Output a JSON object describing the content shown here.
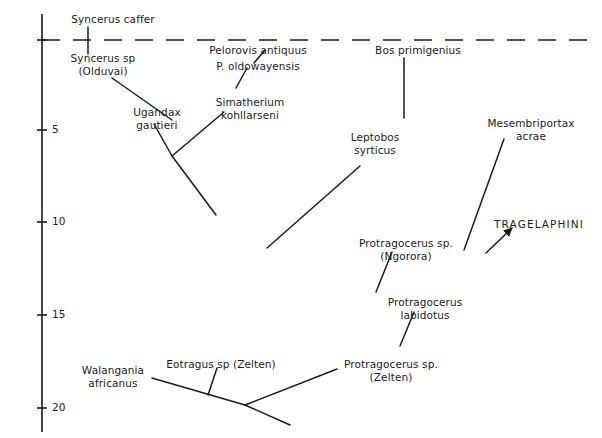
{
  "figure": {
    "type": "phylogenetic-tree",
    "background_color": "#ffffff",
    "line_color": "#1a1a1a",
    "axis": {
      "name": "geologic-time-axis",
      "orientation": "vertical",
      "unit_implied": "Ma",
      "ticks": [
        {
          "label": "5",
          "value": 5,
          "y": 130
        },
        {
          "label": "10",
          "value": 10,
          "y": 222
        },
        {
          "label": "15",
          "value": 15,
          "y": 315
        },
        {
          "label": "20",
          "value": 20,
          "y": 408
        }
      ],
      "top_datum_tick": {
        "label": "",
        "value": 0,
        "y": 40
      },
      "x": 42,
      "y_top": 14,
      "y_bottom": 432
    },
    "datum_line": {
      "name": "present-day-dashed-line",
      "style": "dashed",
      "y": 40,
      "x_start": 42,
      "x_end": 598
    }
  },
  "taxa": [
    {
      "id": "syncerus-caffer",
      "label": "Syncerus caffer",
      "lines": [
        "Syncerus caffer"
      ],
      "x": 113,
      "y": 13,
      "align": "center",
      "style": "italic-latin"
    },
    {
      "id": "syncerus-sp-olduvai",
      "label": "Syncerus sp (Olduvai)",
      "lines": [
        "Syncerus sp",
        "(Olduvai)"
      ],
      "x": 103,
      "y": 52,
      "align": "center",
      "style": "italic-latin"
    },
    {
      "id": "pelorovis-antiquus",
      "label": "Pelorovis antiquus",
      "lines": [
        "Pelorovis antiquus"
      ],
      "x": 258,
      "y": 44,
      "align": "center",
      "style": "italic-latin"
    },
    {
      "id": "p-oldowayensis",
      "label": "P. oldowayensis",
      "lines": [
        "P. oldowayensis"
      ],
      "x": 258,
      "y": 60,
      "align": "center",
      "style": "italic-latin"
    },
    {
      "id": "bos-primigenius",
      "label": "Bos primigenius",
      "lines": [
        "Bos primigenius"
      ],
      "x": 418,
      "y": 44,
      "align": "center",
      "style": "italic-latin"
    },
    {
      "id": "simatherium-kohllarseni",
      "label": "Simatherium kohllarseni",
      "lines": [
        "Simatherium",
        "kohllarseni"
      ],
      "x": 250,
      "y": 96,
      "align": "center",
      "style": "italic-latin"
    },
    {
      "id": "ugandax-gautieri",
      "label": "Ugandax gautieri",
      "lines": [
        "Ugandax",
        "gautieri"
      ],
      "x": 157,
      "y": 106,
      "align": "center",
      "style": "italic-latin"
    },
    {
      "id": "leptobos-syrticus",
      "label": "Leptobos syrticus",
      "lines": [
        "Leptobos",
        "syrticus"
      ],
      "x": 375,
      "y": 131,
      "align": "center",
      "style": "italic-latin"
    },
    {
      "id": "mesembriportax-acrae",
      "label": "Mesembriportax acrae",
      "lines": [
        "Mesembriportax",
        "acrae"
      ],
      "x": 531,
      "y": 117,
      "align": "center",
      "style": "italic-latin"
    },
    {
      "id": "tragelaphini",
      "label": "TRAGELAPHINI",
      "lines": [
        "TRAGELAPHINI"
      ],
      "x": 539,
      "y": 218,
      "align": "center",
      "style": "tribe-caps"
    },
    {
      "id": "protragocerus-sp-ngorora",
      "label": "Protragocerus sp. (Ngorora)",
      "lines": [
        "Protragocerus sp.",
        "(Ngorora)"
      ],
      "x": 406,
      "y": 237,
      "align": "center",
      "style": "italic-latin"
    },
    {
      "id": "protragocerus-labidotus",
      "label": "Protragocerus labidotus",
      "lines": [
        "Protragocerus",
        "labidotus"
      ],
      "x": 425,
      "y": 296,
      "align": "center",
      "style": "italic-latin"
    },
    {
      "id": "eotragus-sp-zelten",
      "label": "Eotragus sp (Zelten)",
      "lines": [
        "Eotragus sp (Zelten)"
      ],
      "x": 221,
      "y": 358,
      "align": "center",
      "style": "italic-latin"
    },
    {
      "id": "protragocerus-sp-zelten",
      "label": "Protragocerus sp. (Zelten)",
      "lines": [
        "Protragocerus sp.",
        "(Zelten)"
      ],
      "x": 391,
      "y": 358,
      "align": "center",
      "style": "italic-latin"
    },
    {
      "id": "walangania-africanus",
      "label": "Walangania africanus",
      "lines": [
        "Walangania",
        "africanus"
      ],
      "x": 113,
      "y": 364,
      "align": "center",
      "style": "italic-latin"
    }
  ],
  "branches": [
    {
      "id": "syncerus-caffer-stem",
      "type": "line",
      "points": "88,27 88,54"
    },
    {
      "id": "bos-primigenius-stem",
      "type": "line",
      "points": "404,58 404,118"
    },
    {
      "id": "syncerus-sp-to-node",
      "type": "line",
      "points": "112,78 172,120"
    },
    {
      "id": "pelorovis-to-oldowayensis",
      "type": "line",
      "points": "265,50 254,63"
    },
    {
      "id": "oldowayensis-to-simatherium",
      "type": "line",
      "points": "247,68 236,88"
    },
    {
      "id": "simatherium-to-node",
      "type": "line",
      "points": "224,112 172,156"
    },
    {
      "id": "ugandax-to-node",
      "type": "line",
      "points": "154,124 172,156"
    },
    {
      "id": "node-to-lower-right",
      "type": "line",
      "points": "172,156 216,215"
    },
    {
      "id": "leptobos-stem",
      "type": "line",
      "points": "360,166 267,248"
    },
    {
      "id": "ngorora-stem",
      "type": "line",
      "points": "392,252 376,292"
    },
    {
      "id": "labidotus-stem",
      "type": "line",
      "points": "414,312 400,346"
    },
    {
      "id": "mesembriportax-stem",
      "type": "line",
      "points": "504,139 464,250"
    },
    {
      "id": "tragelaphini-arrow",
      "type": "arrow",
      "points": "486,253 512,228"
    },
    {
      "id": "walangania-to-node",
      "type": "line",
      "points": "152,378 245,405"
    },
    {
      "id": "eotragus-stem",
      "type": "line",
      "points": "217,368 208,395"
    },
    {
      "id": "zelten-protragocerus-stem",
      "type": "line",
      "points": "337,369 245,405"
    },
    {
      "id": "node-to-base",
      "type": "line",
      "points": "245,405 290,425"
    }
  ]
}
